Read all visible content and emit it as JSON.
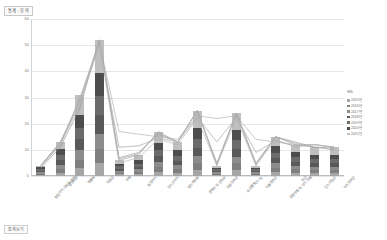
{
  "title": "통계 : 요약",
  "caption": "통계보기",
  "chart_data": {
    "type": "bar",
    "title": "통계 : 요약",
    "xlabel": "",
    "ylabel": "",
    "ylim": [
      0,
      60
    ],
    "yticks": [
      "0",
      "10",
      "20",
      "30",
      "40",
      "50",
      "60"
    ],
    "grid": true,
    "legend_position": "right",
    "legend_title": "년도",
    "stacked": true,
    "overlay": "line",
    "categories": [
      "영업이익 대비율 합계",
      "유형자산",
      "매출액",
      "자본금",
      "부채",
      "영업이익",
      "당기순이익",
      "법인세비용",
      "판매비 및 관리비",
      "자본잉여금",
      "자산총계(누적)",
      "이월결손금",
      "유동부채 및 장기 부채",
      "현금",
      "단기차입금",
      "이익잉여금"
    ],
    "series": [
      {
        "name": "2015년",
        "color": "#a6a6a6",
        "values": [
          0.4,
          1.3,
          3.0,
          5.0,
          0.6,
          0.8,
          1.7,
          1.3,
          2.4,
          0.4,
          2.3,
          0.4,
          1.5,
          1.2,
          1.1,
          1.1
        ]
      },
      {
        "name": "2016년",
        "color": "#7f7f7f",
        "values": [
          0.5,
          1.5,
          3.3,
          5.4,
          0.7,
          0.9,
          1.8,
          1.4,
          2.6,
          0.4,
          2.5,
          0.4,
          1.6,
          1.3,
          1.2,
          1.2
        ]
      },
      {
        "name": "2017년",
        "color": "#8c8c8c",
        "values": [
          0.5,
          1.6,
          3.6,
          5.8,
          0.7,
          0.9,
          1.9,
          1.5,
          2.7,
          0.4,
          2.6,
          0.4,
          1.7,
          1.3,
          1.2,
          1.2
        ]
      },
      {
        "name": "2018년",
        "color": "#595959",
        "values": [
          0.6,
          1.8,
          4.1,
          7.0,
          0.8,
          1.0,
          2.2,
          1.7,
          3.2,
          0.5,
          3.1,
          0.5,
          2.0,
          1.6,
          1.4,
          1.4
        ]
      },
      {
        "name": "2019년",
        "color": "#6b6b6b",
        "values": [
          0.6,
          1.9,
          4.4,
          7.4,
          0.9,
          1.1,
          2.4,
          1.8,
          3.4,
          0.5,
          3.3,
          0.5,
          2.1,
          1.7,
          1.5,
          1.5
        ]
      },
      {
        "name": "2020년",
        "color": "#4d4d4d",
        "values": [
          0.7,
          2.2,
          5.1,
          8.6,
          1.0,
          1.3,
          2.8,
          2.1,
          4.0,
          0.6,
          3.9,
          0.6,
          2.5,
          2.0,
          1.8,
          1.8
        ]
      },
      {
        "name": "2021년",
        "color": "#bfbfbf",
        "values": [
          0.7,
          2.7,
          7.5,
          12.8,
          1.3,
          2.0,
          4.2,
          3.2,
          6.7,
          0.7,
          6.3,
          0.7,
          3.6,
          2.9,
          2.8,
          2.8
        ]
      }
    ],
    "totals": [
      4,
      13,
      31,
      52,
      6,
      8,
      17,
      13,
      25,
      4,
      24,
      4,
      15,
      12,
      11,
      11
    ],
    "lines": [
      {
        "name": "추세1",
        "color": "#9a9a9a",
        "values": [
          4,
          13,
          29,
          52,
          6,
          8,
          17,
          13,
          25,
          4,
          24,
          4,
          15,
          12,
          11,
          11
        ]
      },
      {
        "name": "추세2",
        "color": "#a8a8a8",
        "values": [
          4,
          12,
          30,
          51,
          17,
          16,
          15,
          14,
          23,
          22,
          23,
          14,
          13,
          12,
          12,
          11
        ]
      },
      {
        "name": "추세3",
        "color": "#8f8f8f",
        "values": [
          3,
          11,
          26,
          52,
          7,
          9,
          16,
          13,
          25,
          5,
          24,
          5,
          15,
          13,
          11,
          10
        ]
      },
      {
        "name": "추세4",
        "color": "#b0b0b0",
        "values": [
          4,
          13,
          28,
          50,
          5,
          7,
          14,
          12,
          22,
          4,
          22,
          4,
          14,
          11,
          12,
          11
        ]
      }
    ]
  }
}
